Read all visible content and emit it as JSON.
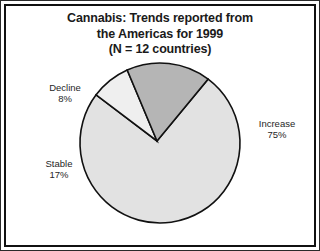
{
  "figure": {
    "background_color": "#ffffff",
    "border_color": "#111111",
    "width": 320,
    "height": 251
  },
  "title": {
    "line1": "Cannabis: Trends reported from",
    "line2": "the Americas for 1999",
    "line3": "(N = 12 countries)",
    "color": "#1a1a1a"
  },
  "labels": {
    "increase": {
      "name": "Increase",
      "value": "75%"
    },
    "stable": {
      "name": "Stable",
      "value": "17%"
    },
    "decline": {
      "name": "Decline",
      "value": "8%"
    }
  },
  "chart_data": {
    "type": "pie",
    "title": "Cannabis: Trends reported from the Americas for 1999 (N = 12 countries)",
    "subtitle": "(N = 12 countries)",
    "xlabel": "",
    "ylabel": "",
    "unit": "percent",
    "total": 100,
    "n_countries": 12,
    "legend_position": "none",
    "grid": false,
    "categories": [
      "Increase",
      "Stable",
      "Decline"
    ],
    "values": [
      75,
      17,
      8
    ],
    "slices": [
      {
        "label": "Increase",
        "value": 75,
        "display": "75%",
        "color": "#e2e2e2",
        "edge_color": "#111111"
      },
      {
        "label": "Stable",
        "value": 17,
        "display": "17%",
        "color": "#b5b5b5",
        "edge_color": "#111111"
      },
      {
        "label": "Decline",
        "value": 8,
        "display": "8%",
        "color": "#efefef",
        "edge_color": "#111111"
      }
    ],
    "geometry": {
      "center_x": 160,
      "center_y": 143,
      "radius": 80,
      "start_angle_deg": 143,
      "direction": "clockwise",
      "vertex_x": 157,
      "vertex_y": 141
    }
  }
}
